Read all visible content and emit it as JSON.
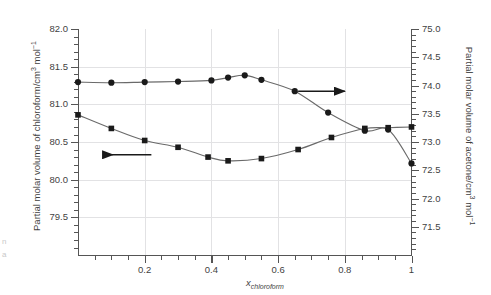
{
  "chart_data": {
    "type": "line",
    "title": "",
    "xlabel": "x_chloroform",
    "xlabel_base": "x",
    "xlabel_sub": "chloroform",
    "ylabel_left": "Partial molar volume of chloroform/cm3 mol-1",
    "ylabel_left_parts": {
      "a": "Partial molar volume of chloroform/cm",
      "sup1": "3",
      "b": " mol",
      "sup2": "−1"
    },
    "ylabel_right": "Partial molar volume of acetone/cm3 mol-1",
    "ylabel_right_parts": {
      "a": "Partial molar volume of acetone/cm",
      "sup1": "3",
      "b": " mol",
      "sup2": "−1"
    },
    "xlim": [
      0,
      1
    ],
    "ylim_left": [
      79.0,
      82.0
    ],
    "ylim_right": [
      71.0,
      75.0
    ],
    "xticks": [
      0.2,
      0.4,
      0.6,
      0.8,
      1
    ],
    "xticklabels": [
      "0.2",
      "0.4",
      "0.6",
      "0.8",
      "1"
    ],
    "yticks_left": [
      79.5,
      80.0,
      80.5,
      81.0,
      81.5,
      82.0
    ],
    "yticklabels_left": [
      "79.5",
      "80.0",
      "80.5",
      "81.0",
      "81.5",
      "82.0"
    ],
    "yticks_right": [
      71.5,
      72.0,
      72.5,
      73.0,
      73.5,
      74.0,
      74.5,
      75.0
    ],
    "yticklabels_right": [
      "71.5",
      "72.0",
      "72.5",
      "73.0",
      "73.5",
      "74.0",
      "74.5",
      "75.0"
    ],
    "grid": true,
    "grid_axis": "both",
    "legend": "none",
    "series": [
      {
        "name": "Partial molar volume of acetone",
        "axis": "right",
        "marker": "circle",
        "color": "#1a1a1a",
        "line_color": "#6a6a6a",
        "x": [
          0.0,
          0.1,
          0.2,
          0.3,
          0.4,
          0.45,
          0.5,
          0.55,
          0.65,
          0.75,
          0.86,
          0.93,
          1.0
        ],
        "values": [
          74.06,
          74.05,
          74.06,
          74.07,
          74.09,
          74.14,
          74.18,
          74.1,
          73.9,
          73.52,
          73.2,
          73.22,
          72.62
        ]
      },
      {
        "name": "Partial molar volume of chloroform",
        "axis": "left",
        "marker": "square",
        "color": "#1a1a1a",
        "line_color": "#6a6a6a",
        "x": [
          0.0,
          0.1,
          0.2,
          0.3,
          0.39,
          0.45,
          0.55,
          0.66,
          0.76,
          0.86,
          0.93,
          1.0
        ],
        "values": [
          80.86,
          80.68,
          80.52,
          80.43,
          80.3,
          80.25,
          80.28,
          80.4,
          80.56,
          80.68,
          80.69,
          80.7
        ]
      }
    ],
    "annotations": [
      {
        "name": "left-arrow-annotation",
        "direction": "left",
        "meaning": "squares read on left axis",
        "x_start": 0.22,
        "x_end": 0.1,
        "y_left_axis": 80.33
      },
      {
        "name": "right-arrow-annotation",
        "direction": "right",
        "meaning": "circles read on right axis",
        "x_start": 0.66,
        "x_end": 0.8,
        "y_right_axis": 73.9
      }
    ]
  },
  "figure": {
    "background_color": "#ffffff",
    "frame_color": "#555555",
    "grid_color": "#e2e2e4",
    "marker_color": "#1a1a1a",
    "line_color": "#6a6a6a"
  },
  "edge_artifacts": {
    "top_right": "å",
    "left_a": "n",
    "left_b": "a"
  }
}
